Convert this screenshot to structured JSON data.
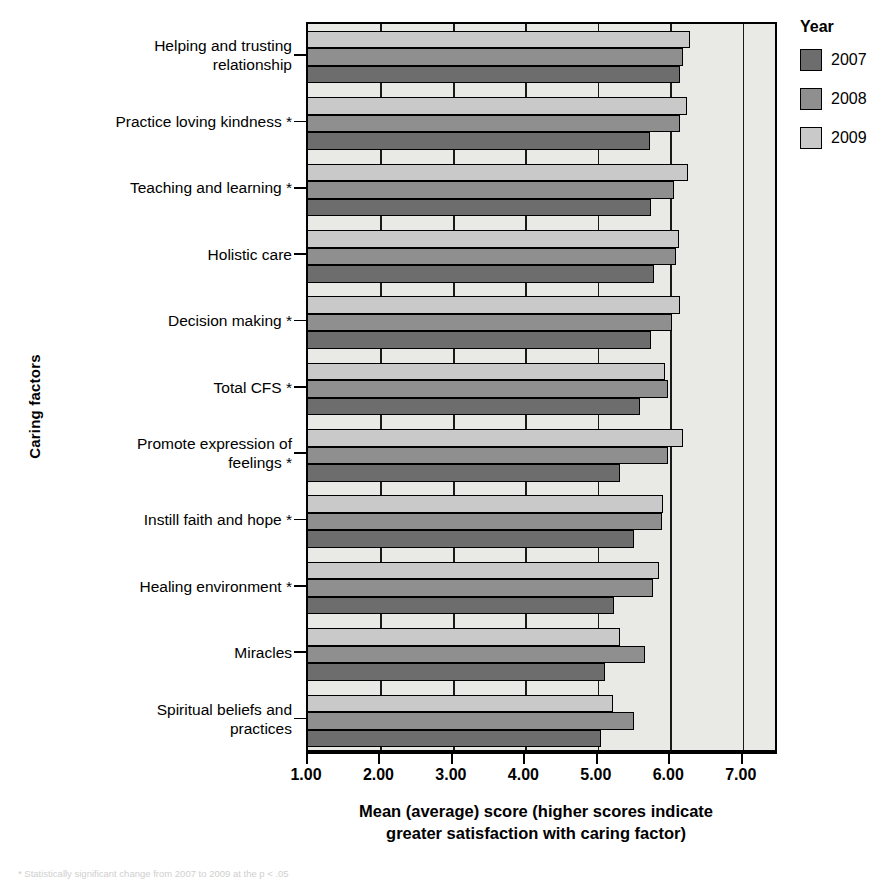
{
  "chart_data": {
    "type": "bar",
    "orientation": "horizontal",
    "title": "",
    "xlabel": "Mean (average) score (higher scores indicate greater satisfaction with caring factor)",
    "ylabel": "Caring factors",
    "xlim": [
      1.0,
      7.5
    ],
    "xticks": [
      "1.00",
      "2.00",
      "3.00",
      "4.00",
      "5.00",
      "6.00",
      "7.00"
    ],
    "xtick_values": [
      1,
      2,
      3,
      4,
      5,
      6,
      7
    ],
    "grid": true,
    "legend_position": "right",
    "legend_title": "Year",
    "categories": [
      "Helping and trusting\nrelationship",
      "Practice loving kindness *",
      "Teaching and learning *",
      "Holistic care",
      "Decision making *",
      "Total CFS *",
      "Promote expression of\nfeelings *",
      "Instill faith and hope *",
      "Healing environment *",
      "Miracles",
      "Spiritual beliefs and\npractices"
    ],
    "series": [
      {
        "name": "2007",
        "color": "#6d6d6d",
        "values": [
          6.13,
          5.72,
          5.73,
          5.78,
          5.74,
          5.58,
          5.31,
          5.5,
          5.22,
          5.1,
          5.05
        ]
      },
      {
        "name": "2008",
        "color": "#8f8f8f",
        "values": [
          6.18,
          6.13,
          6.05,
          6.08,
          6.03,
          5.97,
          5.97,
          5.88,
          5.76,
          5.65,
          5.5
        ]
      },
      {
        "name": "2009",
        "color": "#c9c9c9",
        "values": [
          6.27,
          6.23,
          6.25,
          6.12,
          6.13,
          5.92,
          6.18,
          5.9,
          5.84,
          5.31,
          5.21
        ]
      }
    ]
  },
  "legend": {
    "title": "Year",
    "items": [
      {
        "label": "2007",
        "color": "#6d6d6d"
      },
      {
        "label": "2008",
        "color": "#8f8f8f"
      },
      {
        "label": "2009",
        "color": "#c9c9c9"
      }
    ]
  },
  "axes": {
    "y_title": "Caring factors",
    "x_title_line1": "Mean (average) score (higher scores indicate",
    "x_title_line2": "greater satisfaction with caring factor)"
  },
  "caption": "* Statistically significant change from 2007 to 2009 at the p < .05"
}
